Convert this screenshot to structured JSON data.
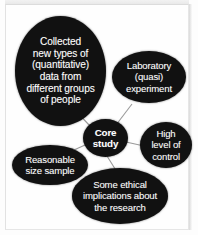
{
  "diagram": {
    "type": "mind-map",
    "background_color": "#fdfdfd",
    "node_color": "#111111",
    "node_text_color": "#ffffff",
    "connector_color": "#9a9a9a",
    "center": {
      "id": "core",
      "name": "core-study-node",
      "label": "Core\nstudy",
      "bold": true
    },
    "branches": [
      {
        "id": "collected",
        "name": "collected-data-node",
        "label": "Collected\nnew types of\n(quantitative)\ndata from\ndifferent groups\nof people"
      },
      {
        "id": "laboratory",
        "name": "laboratory-experiment-node",
        "label": "Laboratory\n(quasi)\nexperiment"
      },
      {
        "id": "control",
        "name": "high-level-of-control-node",
        "label": "High\nlevel of\ncontrol"
      },
      {
        "id": "sample",
        "name": "reasonable-size-sample-node",
        "label": "Reasonable\nsize sample"
      },
      {
        "id": "ethical",
        "name": "ethical-implications-node",
        "label": "Some ethical\nimplications about\nthe research"
      }
    ],
    "connections": [
      {
        "from": "core",
        "to": "collected"
      },
      {
        "from": "core",
        "to": "laboratory"
      },
      {
        "from": "core",
        "to": "control"
      },
      {
        "from": "core",
        "to": "sample"
      },
      {
        "from": "core",
        "to": "ethical"
      }
    ]
  }
}
